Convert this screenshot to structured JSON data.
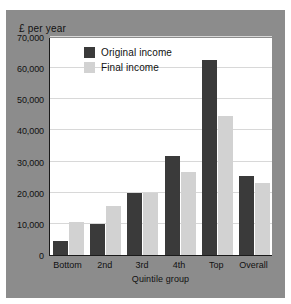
{
  "chart_data": {
    "type": "bar",
    "title": "",
    "subtitle": "",
    "xlabel": "Quintile group",
    "ylabel": "£ per year",
    "categories": [
      "Bottom",
      "2nd",
      "3rd",
      "4th",
      "Top",
      "Overall"
    ],
    "series": [
      {
        "name": "Original income",
        "color": "#3a3a3a",
        "values": [
          4500,
          10100,
          19900,
          31800,
          62500,
          25400
        ]
      },
      {
        "name": "Final income",
        "color": "#d2d2d2",
        "values": [
          10600,
          15700,
          19800,
          26500,
          44500,
          23000
        ]
      }
    ],
    "ylim": [
      0,
      70000
    ],
    "yticks": [
      0,
      10000,
      20000,
      30000,
      40000,
      50000,
      60000,
      70000
    ],
    "ytick_labels": [
      "0",
      "10,000",
      "20,000",
      "30,000",
      "40,000",
      "50,000",
      "60,000",
      "70,000"
    ],
    "grid": true,
    "legend_position": "upper left",
    "plot_background": "#ffffff",
    "figure_background": "#8c8c8c",
    "axis_color": "#1a1a1a",
    "gridline_color": "#d8d8d8"
  }
}
